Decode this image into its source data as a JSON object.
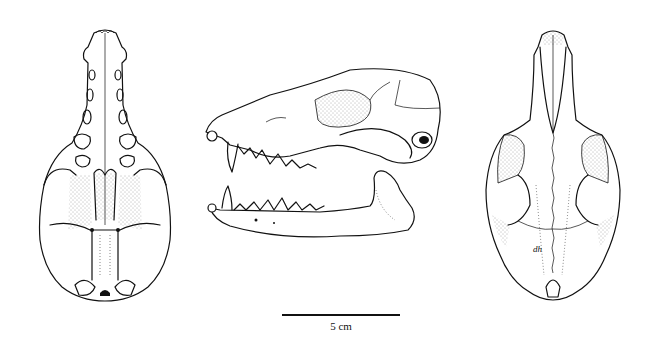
{
  "figure": {
    "views": [
      {
        "id": "ventral",
        "label": "Ventral view of cranium"
      },
      {
        "id": "lateral",
        "label": "Lateral view of cranium and mandible"
      },
      {
        "id": "dorsal",
        "label": "Dorsal view of cranium"
      }
    ],
    "scale_bar": {
      "label": "5 cm",
      "length_px": 118
    },
    "artist_initials": "dh",
    "colors": {
      "ink": "#111111",
      "background": "#ffffff",
      "stipple": "#555555"
    }
  }
}
